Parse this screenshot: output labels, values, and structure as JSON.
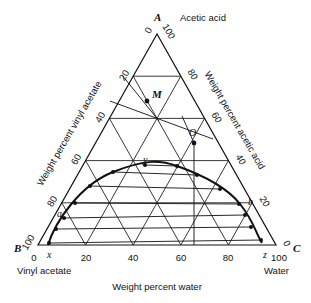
{
  "diagram": {
    "type": "ternary-phase-diagram",
    "vertices": {
      "A": {
        "letter": "A",
        "name": "Acetic acid"
      },
      "B": {
        "letter": "B",
        "name": "Vinyl acetate"
      },
      "C": {
        "letter": "C",
        "name": "Water"
      }
    },
    "axes": {
      "left": {
        "title": "Weight percent vinyl acetate",
        "ticks": [
          "0",
          "20",
          "40",
          "60",
          "80",
          "100"
        ]
      },
      "right": {
        "title": "Weight percent acetic acid",
        "ticks": [
          "100",
          "80",
          "60",
          "40",
          "20",
          "0"
        ]
      },
      "bottom": {
        "title": "Weight percent water",
        "ticks": [
          "0",
          "20",
          "40",
          "60",
          "80",
          "100"
        ]
      }
    },
    "points": {
      "M": "M",
      "O": "O",
      "y": "y",
      "a": "a",
      "b": "b",
      "x": "x",
      "z": "z"
    },
    "colors": {
      "line": "#111111",
      "background": "#ffffff"
    }
  }
}
